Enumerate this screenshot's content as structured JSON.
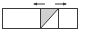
{
  "diagram": {
    "colors": {
      "stroke": "#3a3a3a",
      "fill": "#d0d0d0",
      "background": "#ffffff"
    },
    "outer_box": {
      "x": 2.5,
      "y": 8.5,
      "width": 75,
      "height": 20
    },
    "dividers_x": [
      40.5,
      58.5
    ],
    "diagonal": {
      "x1": 40.5,
      "y1": 28.5,
      "x2": 58.5,
      "y2": 8.5
    },
    "arrows": [
      {
        "direction": "left",
        "x1": 45,
        "x2": 34,
        "y": 4
      },
      {
        "direction": "right",
        "x1": 55,
        "x2": 66,
        "y": 4
      }
    ]
  }
}
